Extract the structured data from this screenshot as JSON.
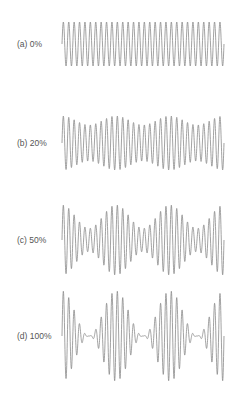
{
  "chart_data": {
    "type": "line",
    "title": "",
    "xlabel": "",
    "ylabel": "",
    "grid": false,
    "legend": "none",
    "carrier_cycles": 30,
    "modulation_cycles": 3,
    "panels": [
      {
        "label": "(a) 0%",
        "modulation_depth": 0.0,
        "center_y": 44,
        "amplitude_px": 22
      },
      {
        "label": "(b) 20%",
        "modulation_depth": 0.2,
        "center_y": 143,
        "amplitude_px": 27
      },
      {
        "label": "(c) 50%",
        "modulation_depth": 0.5,
        "center_y": 240,
        "amplitude_px": 35
      },
      {
        "label": "(d) 100%",
        "modulation_depth": 1.0,
        "center_y": 336,
        "amplitude_px": 45
      }
    ]
  },
  "style": {
    "line_color": "#8a8a8a",
    "label_color": "#555555",
    "x_start": 62,
    "x_end": 224
  }
}
